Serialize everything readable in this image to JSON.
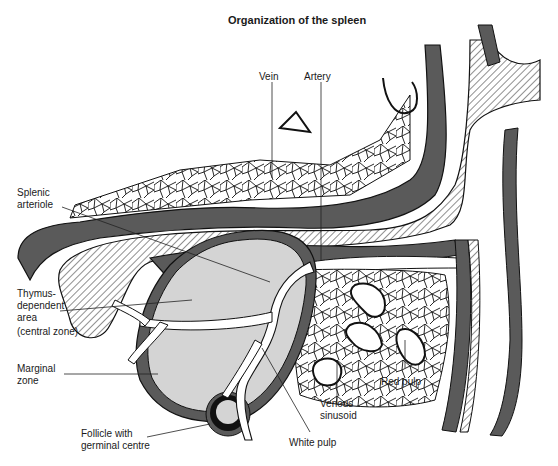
{
  "title": "Organization of the spleen",
  "colors": {
    "background": "#ffffff",
    "vessel_wall": "#5a5a5a",
    "white_pulp": "#d4d4d4",
    "outline": "#111111",
    "hatch": "#333333",
    "germinal_ring": "#111111"
  },
  "labels": {
    "vein": "Vein",
    "artery": "Artery",
    "splenic_arteriole": [
      "Splenic",
      "arteriole"
    ],
    "thymus_dependent_area": [
      "Thymus-",
      "dependent",
      "area",
      "(central zone)"
    ],
    "marginal_zone": [
      "Marginal",
      "zone"
    ],
    "follicle": [
      "Follicle with",
      "germinal centre"
    ],
    "venous_sinusoid": [
      "Venous",
      "sinusoid"
    ],
    "red_pulp": "Red pulp",
    "white_pulp": "White pulp"
  }
}
